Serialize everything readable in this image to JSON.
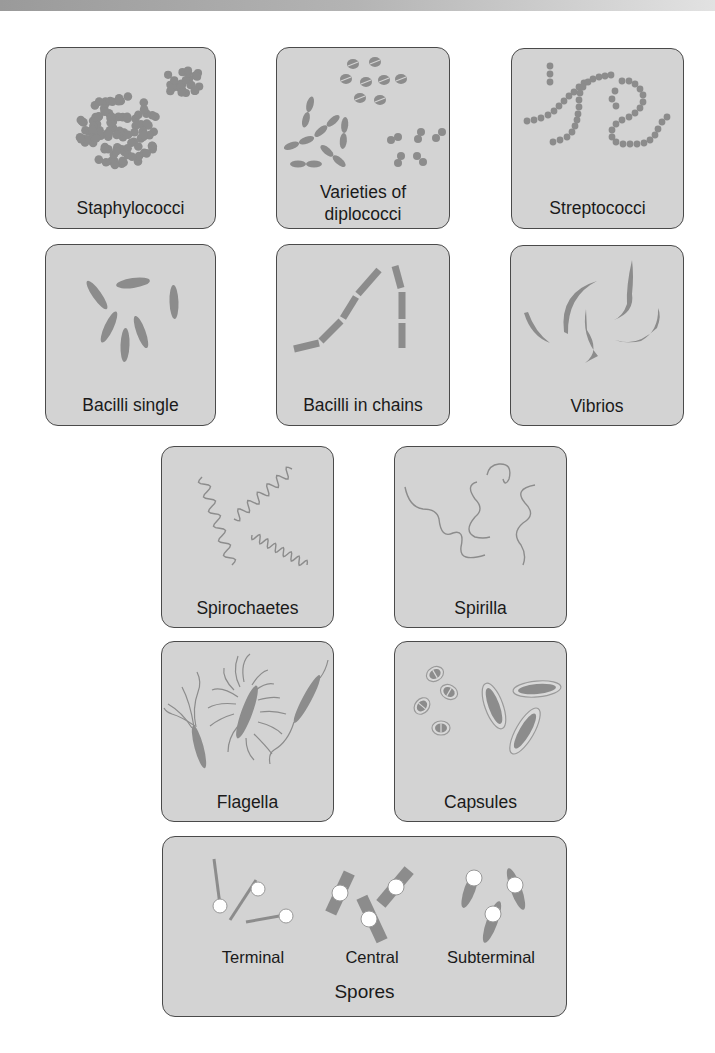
{
  "figure": {
    "colors": {
      "panel_bg": "#d3d3d3",
      "panel_border": "#4a4a4a",
      "cell_fill": "#8c8c8c",
      "spore_fill": "#ffffff",
      "text": "#1a1a1a"
    }
  },
  "panels": {
    "staphylococci": {
      "label": "Staphylococci",
      "icon": "grape-like-cluster-of-cocci"
    },
    "diplococci": {
      "label_line1": "Varieties of",
      "label_line2": "diplococci",
      "icon": "paired-cocci"
    },
    "streptococci": {
      "label": "Streptococci",
      "icon": "chain-of-cocci"
    },
    "bacilli_single": {
      "label": "Bacilli single",
      "icon": "single-rods"
    },
    "bacilli_chains": {
      "label": "Bacilli in chains",
      "icon": "chained-rods"
    },
    "vibrios": {
      "label": "Vibrios",
      "icon": "curved-comma-rods"
    },
    "spirochaetes": {
      "label": "Spirochaetes",
      "icon": "tight-spiral"
    },
    "spirilla": {
      "label": "Spirilla",
      "icon": "loose-spiral"
    },
    "flagella": {
      "label": "Flagella",
      "icon": "flagellated-rods"
    },
    "capsules": {
      "label": "Capsules",
      "icon": "encapsulated-cells"
    },
    "spores": {
      "label": "Spores",
      "types": [
        {
          "label": "Terminal",
          "icon": "terminal-spore"
        },
        {
          "label": "Central",
          "icon": "central-spore"
        },
        {
          "label": "Subterminal",
          "icon": "subterminal-spore"
        }
      ]
    }
  }
}
